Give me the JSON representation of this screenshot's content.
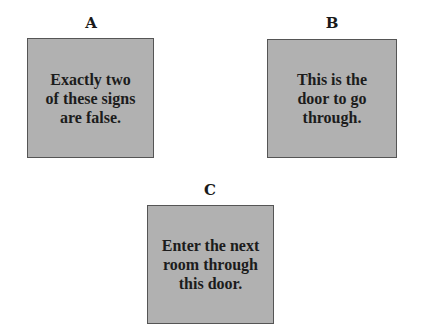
{
  "signs": [
    {
      "label": "A",
      "text": "Exactly two\nof these signs\nare false."
    },
    {
      "label": "B",
      "text": "This is the\ndoor to go\nthrough."
    },
    {
      "label": "C",
      "text": "Enter the next\nroom through\nthis door."
    }
  ],
  "colors": {
    "sign_fill": "#b1b1b1",
    "sign_border": "#555555",
    "text": "#1c1c1c"
  }
}
